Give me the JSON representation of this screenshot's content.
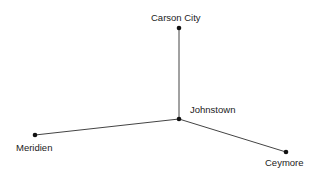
{
  "diagram": {
    "type": "network",
    "nodes": [
      {
        "id": "carson_city",
        "label": "Carson City",
        "x": 179,
        "y": 28
      },
      {
        "id": "johnstown",
        "label": "Johnstown",
        "x": 179,
        "y": 119
      },
      {
        "id": "meridien",
        "label": "Meridien",
        "x": 35,
        "y": 135
      },
      {
        "id": "ceymore",
        "label": "Ceymore",
        "x": 286,
        "y": 152
      }
    ],
    "edges": [
      {
        "from": "johnstown",
        "to": "carson_city"
      },
      {
        "from": "johnstown",
        "to": "meridien"
      },
      {
        "from": "johnstown",
        "to": "ceymore"
      }
    ],
    "colors": {
      "line": "#444444",
      "node": "#111111",
      "text": "#222222"
    }
  }
}
